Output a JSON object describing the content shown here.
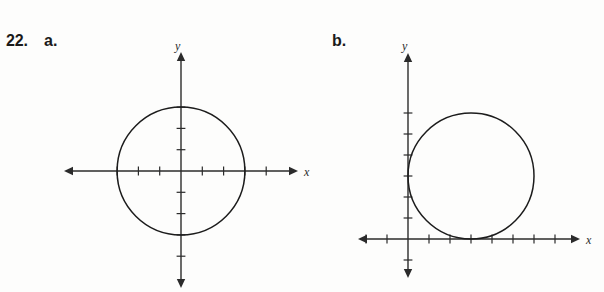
{
  "exercise": {
    "number": "22.",
    "parts": [
      {
        "key": "a",
        "label": "a."
      },
      {
        "key": "b",
        "label": "b."
      }
    ]
  },
  "graph_a": {
    "name": "graph-a",
    "x_axis_label": "x",
    "y_axis_label": "y",
    "origin_px": {
      "x": 181,
      "y": 171
    },
    "unit_px": 21.3,
    "x_ticks": [
      -3,
      -2,
      -1,
      1,
      2,
      3,
      4
    ],
    "y_ticks": [
      -4,
      -3,
      -2,
      -1,
      1,
      2,
      3
    ],
    "circle": {
      "center_x": 0,
      "center_y": 0,
      "radius": 3
    }
  },
  "graph_b": {
    "name": "graph-b",
    "x_axis_label": "x",
    "y_axis_label": "y",
    "origin_px": {
      "x": 408,
      "y": 239
    },
    "unit_px": 21.0,
    "x_ticks": [
      -2,
      -1,
      1,
      2,
      3,
      4,
      5,
      6,
      7
    ],
    "y_ticks": [
      -1,
      1,
      2,
      3,
      4,
      5,
      6
    ],
    "circle": {
      "center_x": 3,
      "center_y": 3,
      "radius": 3
    }
  },
  "chart_data": [
    {
      "type": "scatter",
      "title": "22a",
      "xlabel": "x",
      "ylabel": "y",
      "xlim": [
        -4.2,
        5.2
      ],
      "ylim": [
        -5.2,
        4.4
      ],
      "grid": false,
      "curves": [
        {
          "name": "circle",
          "equation": "x^2 + y^2 = 9",
          "center": [
            0,
            0
          ],
          "radius": 3
        }
      ],
      "x_tick_values": [
        -3,
        -2,
        -1,
        1,
        2,
        3,
        4
      ],
      "y_tick_values": [
        -4,
        -3,
        -2,
        -1,
        1,
        2,
        3
      ]
    },
    {
      "type": "scatter",
      "title": "22b",
      "xlabel": "x",
      "ylabel": "y",
      "xlim": [
        -2.9,
        8.3
      ],
      "ylim": [
        -2.0,
        7.2
      ],
      "grid": false,
      "curves": [
        {
          "name": "circle",
          "equation": "(x - 3)^2 + (y - 3)^2 = 9",
          "center": [
            3,
            3
          ],
          "radius": 3
        }
      ],
      "x_tick_values": [
        -2,
        -1,
        1,
        2,
        3,
        4,
        5,
        6,
        7
      ],
      "y_tick_values": [
        -1,
        1,
        2,
        3,
        4,
        5,
        6
      ]
    }
  ],
  "colors": {
    "ink": "#2b2b2b",
    "curve": "#1c1c1c",
    "page": "#fdfdfc"
  }
}
